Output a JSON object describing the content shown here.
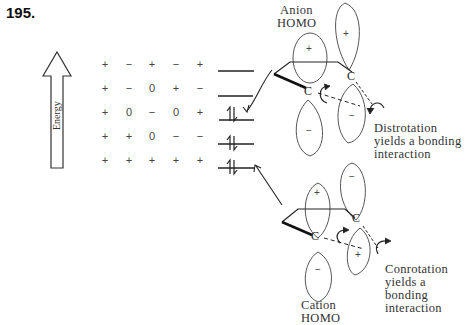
{
  "problem_number": "195.",
  "energy_axis": {
    "label": "Energy"
  },
  "sign_table": {
    "rows": [
      [
        "+",
        "−",
        "+",
        "−",
        "+"
      ],
      [
        "+",
        "−",
        "0",
        "+",
        "−"
      ],
      [
        "+",
        "0",
        "−",
        "0",
        "+"
      ],
      [
        "+",
        "+",
        "0",
        "−",
        "−"
      ],
      [
        "+",
        "+",
        "+",
        "+",
        "+"
      ]
    ]
  },
  "energy_levels": [
    {
      "occupancy": "empty"
    },
    {
      "occupancy": "empty"
    },
    {
      "occupancy": "paired",
      "note": "Anion HOMO"
    },
    {
      "occupancy": "paired",
      "note": "Cation HOMO"
    },
    {
      "occupancy": "paired"
    }
  ],
  "anion": {
    "title_line1": "Anion",
    "title_line2": "HOMO",
    "lobe_signs": {
      "left_top": "+",
      "left_bottom": "−",
      "right_top": "+",
      "right_bottom": "−"
    },
    "atom_labels": [
      "C",
      "C"
    ],
    "caption_line1": "Distrotation",
    "caption_line2": "yields a bonding",
    "caption_line3": "interaction"
  },
  "cation": {
    "title_line1": "Cation",
    "title_line2": "HOMO",
    "lobe_signs": {
      "left_top": "+",
      "left_bottom": "−",
      "right_top": "−",
      "right_bottom": "+"
    },
    "atom_labels": [
      "C",
      "C"
    ],
    "caption_line1": "Conrotation",
    "caption_line2": "yields a bonding",
    "caption_line3": "interaction"
  }
}
